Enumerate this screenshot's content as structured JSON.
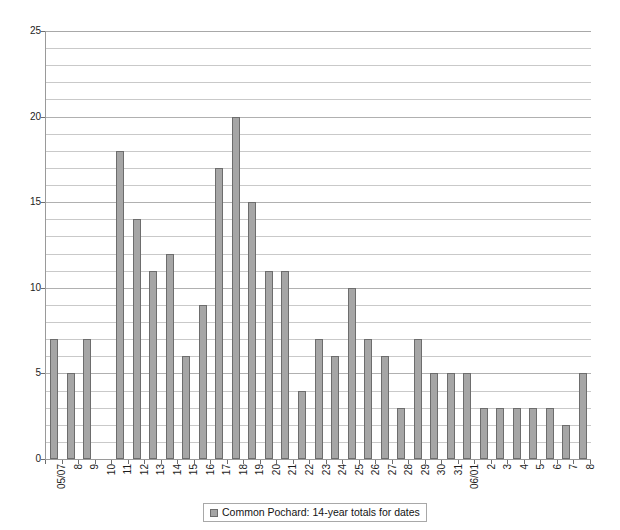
{
  "chart_data": {
    "type": "bar",
    "title": "",
    "xlabel": "",
    "ylabel": "",
    "ylim": [
      0,
      25
    ],
    "yticks": [
      0,
      5,
      10,
      15,
      20,
      25
    ],
    "grid": true,
    "grid_minor_step": 1,
    "legend_position": "bottom",
    "series": [
      {
        "name": "Common Pochard: 14-year totals for dates",
        "color": "#a6a6a6",
        "values": [
          7,
          5,
          7,
          0,
          18,
          14,
          11,
          12,
          6,
          9,
          17,
          20,
          15,
          11,
          11,
          4,
          7,
          6,
          10,
          7,
          6,
          3,
          7,
          5,
          5,
          5,
          3,
          3,
          3,
          3,
          3,
          2,
          5
        ]
      }
    ],
    "categories": [
      "05/07",
      "8",
      "9",
      "10",
      "11",
      "12",
      "13",
      "14",
      "15",
      "16",
      "17",
      "18",
      "19",
      "20",
      "21",
      "22",
      "23",
      "24",
      "25",
      "26",
      "27",
      "28",
      "29",
      "30",
      "31",
      "06/01",
      "2",
      "3",
      "4",
      "5",
      "6",
      "7",
      "8"
    ]
  },
  "legend": {
    "entries": [
      {
        "label": "Common Pochard: 14-year totals for dates",
        "swatch_color": "#a6a6a6"
      }
    ]
  },
  "axes": {
    "y_axis_color": "#9a9a9a",
    "x_axis_color": "#9a9a9a",
    "gridline_color": "#c9c9c9"
  },
  "title_sliver": {
    "text": "···"
  }
}
